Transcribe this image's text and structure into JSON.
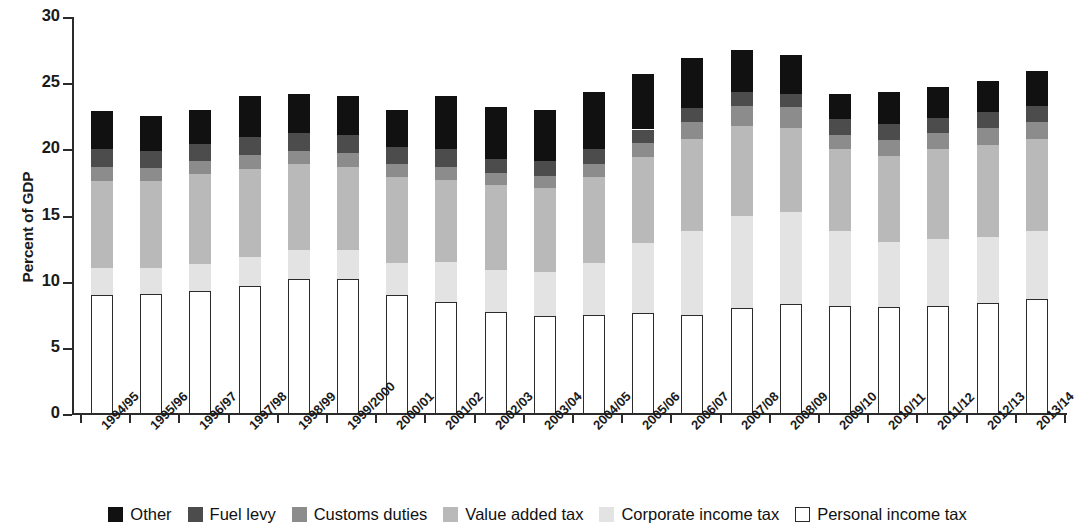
{
  "chart_data": {
    "type": "bar",
    "subtype": "stacked",
    "title": "",
    "xlabel": "",
    "ylabel": "Percent of GDP",
    "ylim": [
      0,
      30
    ],
    "yticks": [
      0,
      5,
      10,
      15,
      20,
      25,
      30
    ],
    "ytick_labels": [
      "0",
      "5",
      "10",
      "15",
      "20",
      "25",
      "30"
    ],
    "grid": false,
    "legend_position": "bottom",
    "categories": [
      "1994/95",
      "1995/96",
      "1996/97",
      "1997/98",
      "1998/99",
      "1999/2000",
      "2000/01",
      "2001/02",
      "2002/03",
      "2003/04",
      "2004/05",
      "2005/06",
      "2006/07",
      "2007/08",
      "2008/09",
      "2009/10",
      "2010/11",
      "2011/12",
      "2012/13",
      "2013/14"
    ],
    "series": [
      {
        "name": "Personal income tax",
        "color": "#ffffff",
        "values": [
          9.0,
          9.1,
          9.3,
          9.7,
          10.2,
          10.2,
          9.0,
          8.5,
          7.7,
          7.4,
          7.5,
          7.6,
          7.5,
          8.0,
          8.3,
          8.2,
          8.1,
          8.2,
          8.4,
          8.7
        ]
      },
      {
        "name": "Corporate income tax",
        "color": "#e3e3e3",
        "values": [
          2.0,
          1.9,
          2.0,
          2.2,
          2.2,
          2.2,
          2.4,
          3.0,
          3.2,
          3.3,
          3.9,
          5.3,
          6.3,
          7.0,
          7.0,
          5.6,
          4.9,
          5.0,
          5.0,
          5.1
        ]
      },
      {
        "name": "Value added tax",
        "color": "#b9b9b9",
        "values": [
          6.6,
          6.6,
          6.8,
          6.6,
          6.5,
          6.3,
          6.5,
          6.2,
          6.4,
          6.4,
          6.5,
          6.5,
          7.0,
          6.8,
          6.3,
          6.2,
          6.5,
          6.8,
          6.9,
          7.0
        ]
      },
      {
        "name": "Customs duties",
        "color": "#8c8c8c",
        "values": [
          1.1,
          1.0,
          1.0,
          1.1,
          1.0,
          1.0,
          1.0,
          1.0,
          0.9,
          0.9,
          1.0,
          1.1,
          1.3,
          1.5,
          1.6,
          1.1,
          1.2,
          1.2,
          1.3,
          1.3
        ]
      },
      {
        "name": "Fuel levy",
        "color": "#4c4c4c",
        "values": [
          1.3,
          1.3,
          1.3,
          1.3,
          1.3,
          1.4,
          1.3,
          1.3,
          1.1,
          1.1,
          1.1,
          1.0,
          1.0,
          1.0,
          1.0,
          1.2,
          1.2,
          1.2,
          1.2,
          1.2
        ]
      },
      {
        "name": "Other",
        "color": "#111111",
        "values": [
          2.9,
          2.6,
          2.6,
          3.1,
          3.0,
          2.9,
          2.8,
          4.0,
          3.9,
          3.9,
          4.3,
          4.2,
          3.8,
          3.2,
          2.9,
          1.9,
          2.4,
          2.3,
          2.4,
          2.6
        ]
      }
    ],
    "totals": [
      22.9,
      22.5,
      23.0,
      23.5,
      24.2,
      24.0,
      23.0,
      24.0,
      23.2,
      23.0,
      24.3,
      25.7,
      26.9,
      27.5,
      27.1,
      24.2,
      24.3,
      24.7,
      25.2,
      25.9
    ]
  },
  "legend": {
    "items": [
      {
        "label": "Other",
        "color": "#111111",
        "style": "filled"
      },
      {
        "label": "Fuel levy",
        "color": "#4c4c4c",
        "style": "filled"
      },
      {
        "label": "Customs duties",
        "color": "#8c8c8c",
        "style": "filled"
      },
      {
        "label": "Value added tax",
        "color": "#b9b9b9",
        "style": "filled"
      },
      {
        "label": "Corporate income tax",
        "color": "#e3e3e3",
        "style": "filled"
      },
      {
        "label": "Personal income tax",
        "color": "#ffffff",
        "style": "outlined"
      }
    ]
  },
  "axis": {
    "y_title": "Percent of GDP"
  }
}
